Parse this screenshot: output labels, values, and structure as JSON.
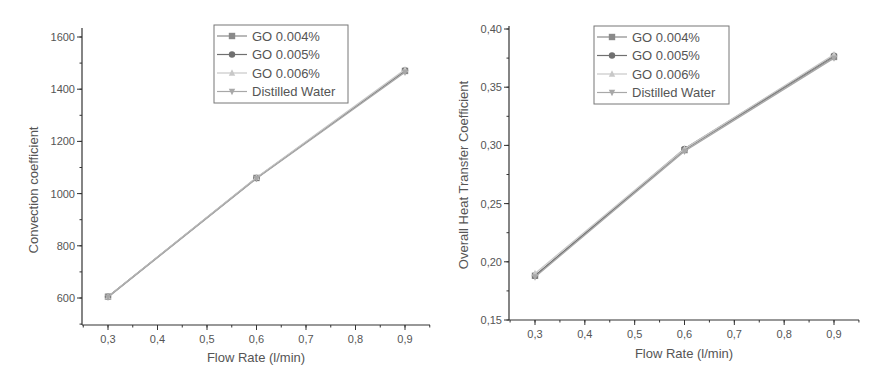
{
  "chart_data": [
    {
      "type": "line",
      "title": "",
      "xlabel": "Flow Rate (l/min)",
      "ylabel": "Convection coefficient",
      "x": [
        0.3,
        0.6,
        0.9
      ],
      "xlim": [
        0.25,
        0.95
      ],
      "ylim": [
        500,
        1600
      ],
      "x_ticks": [
        "0,3",
        "0,4",
        "0,5",
        "0,6",
        "0,7",
        "0,8",
        "0,9"
      ],
      "y_ticks": [
        "600",
        "800",
        "1000",
        "1200",
        "1400",
        "1600"
      ],
      "grid": false,
      "legend_position": "top-right inside",
      "series": [
        {
          "name": "GO 0.004%",
          "marker": "square",
          "values": [
            605,
            1060,
            1470
          ]
        },
        {
          "name": "GO 0.005%",
          "marker": "circle",
          "values": [
            605,
            1060,
            1472
          ]
        },
        {
          "name": "GO 0.006%",
          "marker": "triangle-up",
          "values": [
            605,
            1062,
            1475
          ]
        },
        {
          "name": "Distilled Water",
          "marker": "triangle-down",
          "values": [
            603,
            1058,
            1465
          ]
        }
      ]
    },
    {
      "type": "line",
      "title": "",
      "xlabel": "Flow Rate (l/min)",
      "ylabel": "Overall Heat Transfer Coefficient",
      "x": [
        0.3,
        0.6,
        0.9
      ],
      "xlim": [
        0.25,
        0.95
      ],
      "ylim": [
        0.15,
        0.4
      ],
      "x_ticks": [
        "0,3",
        "0,4",
        "0,5",
        "0,6",
        "0,7",
        "0,8",
        "0,9"
      ],
      "y_ticks": [
        "0,15",
        "0,20",
        "0,25",
        "0,30",
        "0,35",
        "0,40"
      ],
      "grid": false,
      "legend_position": "top-center inside",
      "series": [
        {
          "name": "GO 0.004%",
          "marker": "square",
          "values": [
            0.188,
            0.296,
            0.376
          ]
        },
        {
          "name": "GO 0.005%",
          "marker": "circle",
          "values": [
            0.188,
            0.297,
            0.377
          ]
        },
        {
          "name": "GO 0.006%",
          "marker": "triangle-up",
          "values": [
            0.19,
            0.297,
            0.378
          ]
        },
        {
          "name": "Distilled Water",
          "marker": "triangle-down",
          "values": [
            0.187,
            0.295,
            0.375
          ]
        }
      ]
    }
  ],
  "colors": {
    "axis": "#333333",
    "text": "#555555",
    "series": [
      "#8a8a8a",
      "#707070",
      "#c8c8c8",
      "#a8a8a8"
    ]
  }
}
